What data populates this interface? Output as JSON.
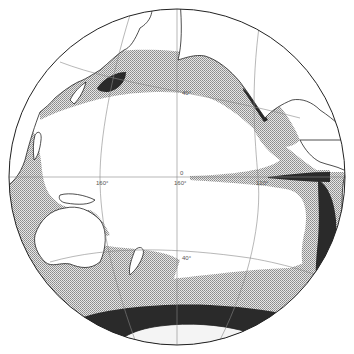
{
  "map": {
    "title": "",
    "projection": "globe view centered on the Pacific Ocean",
    "colors": {
      "background": "#ffffff",
      "ocean": "#ffffff",
      "land": "#ffffff",
      "moderate_zone": "#c4c4c4",
      "high_zone": "#2a2a2a",
      "graticule": "#888888",
      "outline": "#222222"
    },
    "graticule_labels": {
      "lat_north_40": "40°",
      "lat_equator": "0",
      "lat_south_40": "40°",
      "lon_west": "160°",
      "lon_center": "160°",
      "lon_east": "120°"
    },
    "legend": {
      "moderate": "stippled zone",
      "high": "dark zone"
    }
  }
}
